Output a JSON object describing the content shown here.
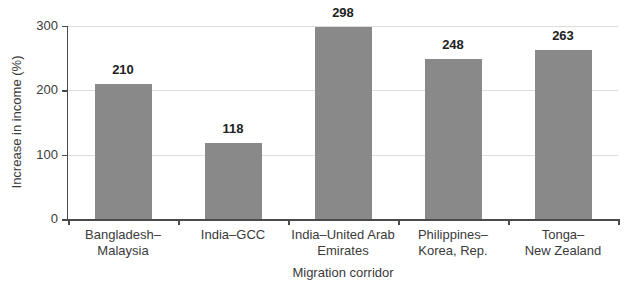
{
  "chart_data": {
    "type": "bar",
    "title": "",
    "categories": [
      "Bangladesh–\nMalaysia",
      "India–GCC",
      "India–United Arab\nEmirates",
      "Philippines–\nKorea, Rep.",
      "Tonga–\nNew Zealand"
    ],
    "values": [
      210,
      118,
      298,
      248,
      263
    ],
    "xlabel": "Migration corridor",
    "ylabel": "Increase in income (%)",
    "ylim": [
      0,
      300
    ],
    "yticks": [
      0,
      100,
      200,
      300
    ],
    "grid": "horizontal",
    "legend": "none",
    "colors": {
      "bar": "#898989",
      "gridline": "#dcdcdc",
      "axis": "#4a4a4a",
      "tick_text": "#3a3a3a",
      "value_text": "#222222",
      "background": "#ffffff"
    }
  }
}
